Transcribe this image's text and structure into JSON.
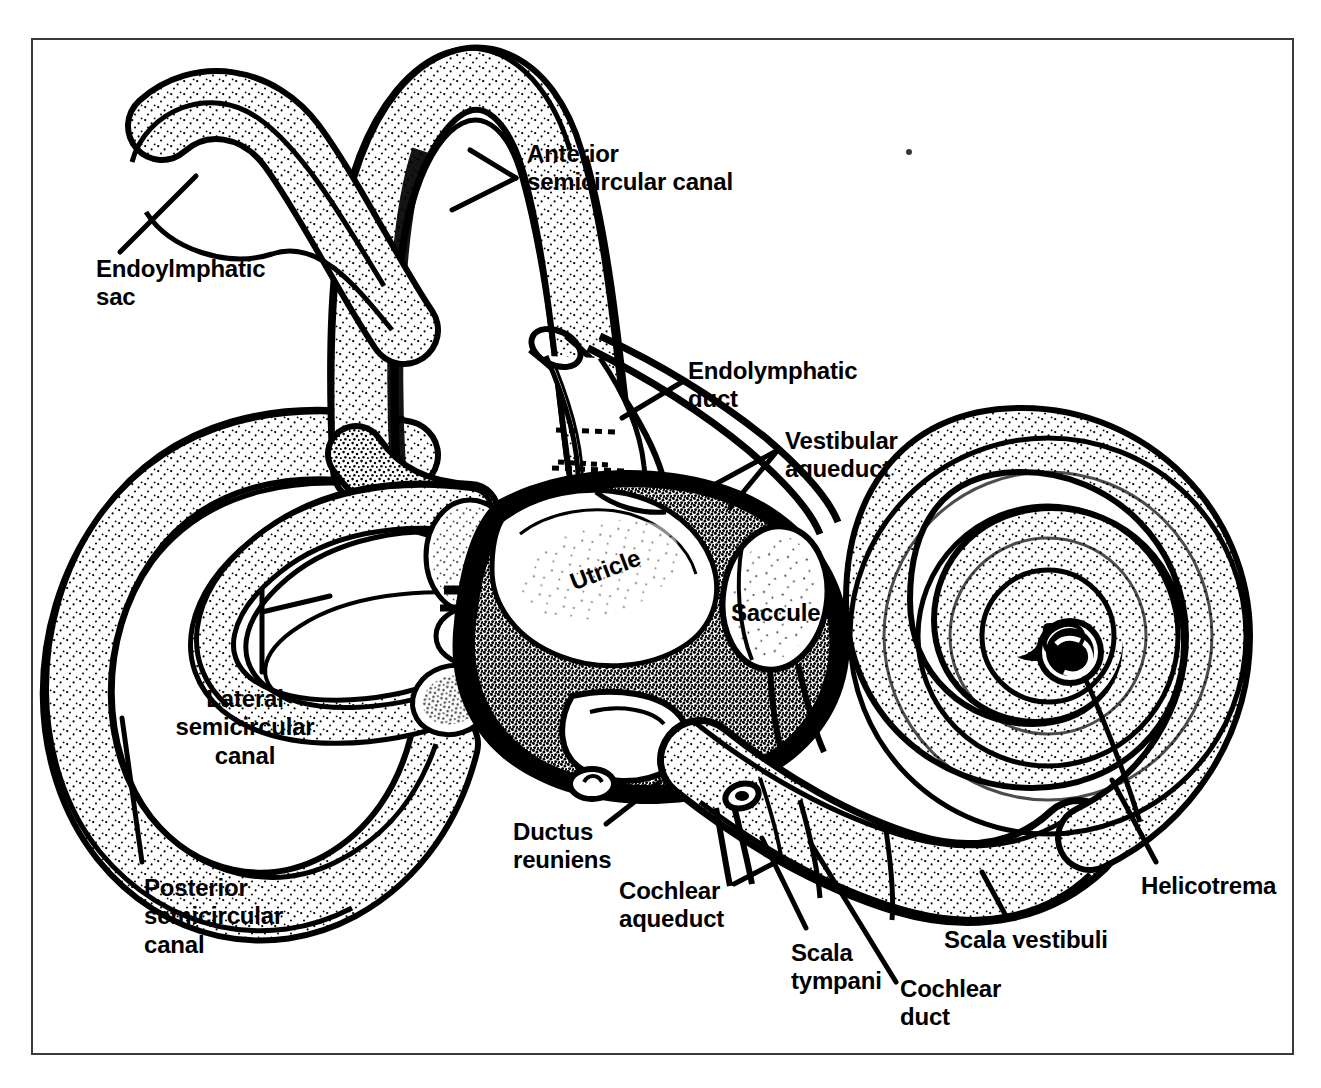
{
  "figure": {
    "domain": "anatomical-line-drawing",
    "style": "black-and-white stippled medical illustration",
    "border_color": "#3a3a3a",
    "ink_color": "#000000",
    "background_color": "#ffffff"
  },
  "labels": [
    {
      "id": "endolymphatic-sac",
      "text": "Endoylmphatic\nsac",
      "x": 96,
      "y": 255,
      "align": "lft"
    },
    {
      "id": "anterior-semicircular-canal",
      "text": "Anterior\nsemicircular canal",
      "x": 527,
      "y": 140,
      "align": "lft"
    },
    {
      "id": "endolymphatic-duct",
      "text": "Endolymphatic\nduct",
      "x": 688,
      "y": 357,
      "align": "lft"
    },
    {
      "id": "vestibular-aqueduct",
      "text": "Vestibular\naqueduct",
      "x": 785,
      "y": 427,
      "align": "lft"
    },
    {
      "id": "utricle",
      "text": "Utricle",
      "x": 566,
      "y": 570,
      "align": "lft"
    },
    {
      "id": "saccule",
      "text": "Saccule",
      "x": 731,
      "y": 599,
      "align": "lft"
    },
    {
      "id": "lateral-semicircular-canal",
      "text": "Lateral\nsemicircular\ncanal",
      "x": 245,
      "y": 685,
      "align": "ctr"
    },
    {
      "id": "posterior-semicircular-canal",
      "text": "Posterior\nsemicircular\ncanal",
      "x": 144,
      "y": 874,
      "align": "lft"
    },
    {
      "id": "ductus-reuniens",
      "text": "Ductus\nreuniens",
      "x": 513,
      "y": 818,
      "align": "lft"
    },
    {
      "id": "cochlear-aqueduct",
      "text": "Cochlear\naqueduct",
      "x": 619,
      "y": 877,
      "align": "lft"
    },
    {
      "id": "scala-tympani",
      "text": "Scala\ntympani",
      "x": 791,
      "y": 939,
      "align": "lft"
    },
    {
      "id": "cochlear-duct",
      "text": "Cochlear\nduct",
      "x": 900,
      "y": 975,
      "align": "lft"
    },
    {
      "id": "scala-vestibuli",
      "text": "Scala vestibuli",
      "x": 944,
      "y": 926,
      "align": "lft"
    },
    {
      "id": "helicotrema",
      "text": "Helicotrema",
      "x": 1141,
      "y": 872,
      "align": "lft"
    }
  ],
  "structures": [
    {
      "id": "endolymphatic-sac",
      "name": "Endolymphatic sac"
    },
    {
      "id": "anterior-semicircular-canal",
      "name": "Anterior semicircular canal"
    },
    {
      "id": "posterior-semicircular-canal",
      "name": "Posterior semicircular canal"
    },
    {
      "id": "lateral-semicircular-canal",
      "name": "Lateral semicircular canal"
    },
    {
      "id": "endolymphatic-duct",
      "name": "Endolymphatic duct"
    },
    {
      "id": "vestibular-aqueduct",
      "name": "Vestibular aqueduct"
    },
    {
      "id": "utricle",
      "name": "Utricle"
    },
    {
      "id": "saccule",
      "name": "Saccule"
    },
    {
      "id": "ductus-reuniens",
      "name": "Ductus reuniens"
    },
    {
      "id": "cochlear-aqueduct",
      "name": "Cochlear aqueduct"
    },
    {
      "id": "cochlea",
      "name": "Cochlea"
    },
    {
      "id": "scala-vestibuli",
      "name": "Scala vestibuli"
    },
    {
      "id": "scala-tympani",
      "name": "Scala tympani"
    },
    {
      "id": "cochlear-duct",
      "name": "Cochlear duct"
    },
    {
      "id": "helicotrema",
      "name": "Helicotrema"
    }
  ]
}
